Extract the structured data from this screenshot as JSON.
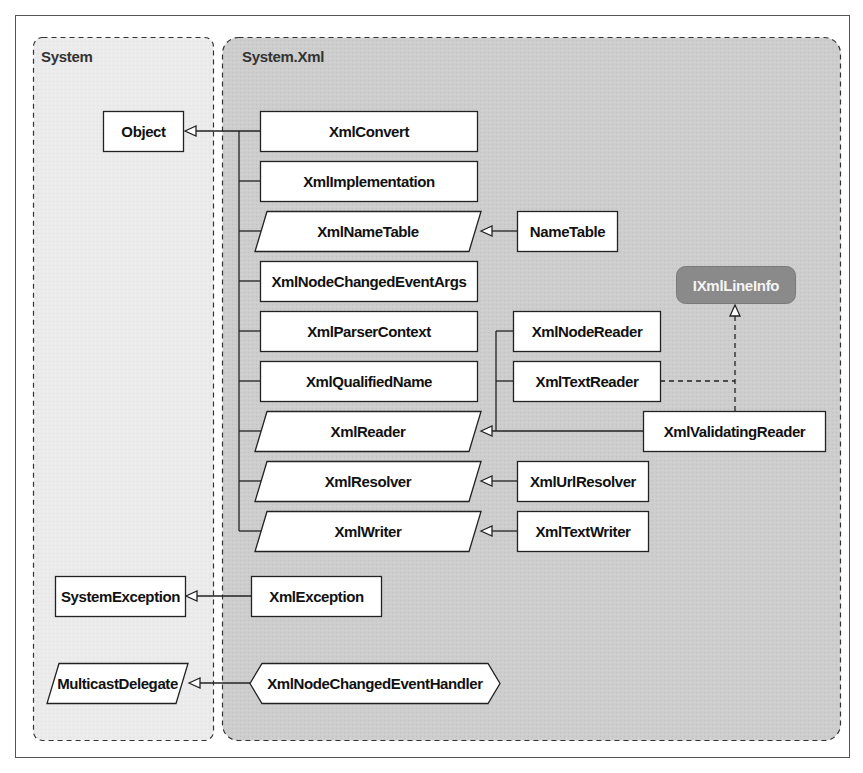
{
  "colors": {
    "frame": "#555555",
    "system_pkg_fill": "#ececec",
    "xml_pkg_fill": "#cfcfcf",
    "box_fill": "#ffffff",
    "box_stroke": "#222222",
    "interface_fill": "#8a8a8a",
    "interface_text": "#f4f4f4"
  },
  "packages": {
    "system": {
      "label": "System"
    },
    "system_xml": {
      "label": "System.Xml"
    }
  },
  "system_types": {
    "object": {
      "label": "Object",
      "shape": "rectangle"
    },
    "system_exception": {
      "label": "SystemException",
      "shape": "rectangle"
    },
    "multicast_delegate": {
      "label": "MulticastDelegate",
      "shape": "parallelogram"
    }
  },
  "xml_types": {
    "xml_convert": {
      "label": "XmlConvert",
      "shape": "rectangle"
    },
    "xml_implementation": {
      "label": "XmlImplementation",
      "shape": "rectangle"
    },
    "xml_name_table": {
      "label": "XmlNameTable",
      "shape": "parallelogram"
    },
    "name_table": {
      "label": "NameTable",
      "shape": "rectangle"
    },
    "xml_node_changed_event_args": {
      "label": "XmlNodeChangedEventArgs",
      "shape": "rectangle"
    },
    "xml_parser_context": {
      "label": "XmlParserContext",
      "shape": "rectangle"
    },
    "xml_qualified_name": {
      "label": "XmlQualifiedName",
      "shape": "rectangle"
    },
    "xml_reader": {
      "label": "XmlReader",
      "shape": "parallelogram"
    },
    "xml_resolver": {
      "label": "XmlResolver",
      "shape": "parallelogram"
    },
    "xml_writer": {
      "label": "XmlWriter",
      "shape": "parallelogram"
    },
    "xml_node_reader": {
      "label": "XmlNodeReader",
      "shape": "rectangle"
    },
    "xml_text_reader": {
      "label": "XmlTextReader",
      "shape": "rectangle"
    },
    "xml_validating_reader": {
      "label": "XmlValidatingReader",
      "shape": "rectangle"
    },
    "ixml_line_info": {
      "label": "IXmlLineInfo",
      "shape": "interface"
    },
    "xml_url_resolver": {
      "label": "XmlUrlResolver",
      "shape": "rectangle"
    },
    "xml_text_writer": {
      "label": "XmlTextWriter",
      "shape": "rectangle"
    },
    "xml_exception": {
      "label": "XmlException",
      "shape": "rectangle"
    },
    "xml_node_changed_event_handler": {
      "label": "XmlNodeChangedEventHandler",
      "shape": "hexagon"
    }
  },
  "relationships": [
    {
      "from": "XmlConvert",
      "to": "Object",
      "type": "inherits"
    },
    {
      "from": "XmlImplementation",
      "to": "Object",
      "type": "inherits"
    },
    {
      "from": "XmlNameTable",
      "to": "Object",
      "type": "inherits"
    },
    {
      "from": "XmlNodeChangedEventArgs",
      "to": "Object",
      "type": "inherits"
    },
    {
      "from": "XmlParserContext",
      "to": "Object",
      "type": "inherits"
    },
    {
      "from": "XmlQualifiedName",
      "to": "Object",
      "type": "inherits"
    },
    {
      "from": "XmlReader",
      "to": "Object",
      "type": "inherits"
    },
    {
      "from": "XmlResolver",
      "to": "Object",
      "type": "inherits"
    },
    {
      "from": "XmlWriter",
      "to": "Object",
      "type": "inherits"
    },
    {
      "from": "NameTable",
      "to": "XmlNameTable",
      "type": "inherits"
    },
    {
      "from": "XmlNodeReader",
      "to": "XmlReader",
      "type": "inherits"
    },
    {
      "from": "XmlTextReader",
      "to": "XmlReader",
      "type": "inherits"
    },
    {
      "from": "XmlValidatingReader",
      "to": "XmlReader",
      "type": "inherits"
    },
    {
      "from": "XmlTextReader",
      "to": "IXmlLineInfo",
      "type": "implements"
    },
    {
      "from": "XmlValidatingReader",
      "to": "IXmlLineInfo",
      "type": "implements"
    },
    {
      "from": "XmlUrlResolver",
      "to": "XmlResolver",
      "type": "inherits"
    },
    {
      "from": "XmlTextWriter",
      "to": "XmlWriter",
      "type": "inherits"
    },
    {
      "from": "XmlException",
      "to": "SystemException",
      "type": "inherits"
    },
    {
      "from": "XmlNodeChangedEventHandler",
      "to": "MulticastDelegate",
      "type": "inherits"
    }
  ]
}
